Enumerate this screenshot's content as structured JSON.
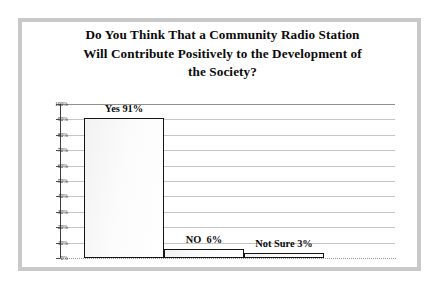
{
  "chart_data": {
    "type": "bar",
    "title": "Do You Think That a Community Radio Station Will Contribute Positively to the Development of the Society?",
    "title_lines": [
      "Do You Think That a Community Radio Station",
      "Will Contribute Positively to the Development of",
      "the Society?"
    ],
    "categories": [
      "Yes",
      "NO",
      "Not Sure"
    ],
    "values": [
      91,
      6,
      3
    ],
    "value_labels": [
      "Yes 91%",
      "NO  6%",
      "Not Sure 3%"
    ],
    "xlabel": "",
    "ylabel": "",
    "ylim": [
      0,
      100
    ],
    "y_ticks": [
      0,
      10,
      20,
      30,
      40,
      50,
      60,
      70,
      80,
      90,
      100
    ],
    "y_tick_labels": [
      "0%",
      "10%",
      "20%",
      "30%",
      "40%",
      "50%",
      "60%",
      "70%",
      "80%",
      "90%",
      "100%"
    ],
    "grid": true,
    "legend": false,
    "bar_fill_color": "#fbfbfb",
    "bar_border_color": "#141414",
    "gridline_color": "#c4c4c4",
    "axis_color": "#3d3d3d",
    "text_color": "#0b0b0b",
    "frame_color": "#c9c9c9"
  }
}
